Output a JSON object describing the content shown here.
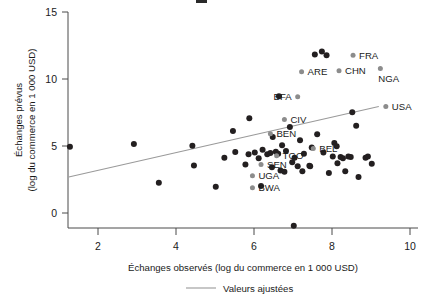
{
  "figure": {
    "width": 430,
    "height": 304,
    "background": "#ffffff",
    "top_crop_artifact": true
  },
  "colors": {
    "point": "#231f20",
    "highlight_point": "#8c8c8c",
    "fit_line": "#9a9a9a",
    "axis": "#4a4a4a",
    "text": "#1a1a1a"
  },
  "chart_data": {
    "type": "scatter",
    "title": "",
    "xlabel": "Échanges observés (log du commerce en 1 000 USD)",
    "ylabel": "Échanges prévus\n(log du commerce en 1 000 USD)",
    "ylabel_line1": "Échanges prévus",
    "ylabel_line2": "(log du commerce en 1 000 USD)",
    "xlim": [
      1.2,
      9.8
    ],
    "ylim": [
      -1.3,
      15.4
    ],
    "xticks": [
      2,
      4,
      6,
      8,
      10
    ],
    "xtick_labels": [
      "2",
      "4",
      "6",
      "8",
      "10"
    ],
    "yticks": [
      0,
      5,
      10,
      15
    ],
    "ytick_labels": [
      "0",
      "5",
      "10",
      "15"
    ],
    "grid": false,
    "legend": {
      "position": "below-axis-center",
      "entries": [
        {
          "label": "Valeurs ajustées",
          "marker": "line",
          "color": "#9a9a9a"
        }
      ]
    },
    "fit_line": {
      "name": "Valeurs ajustées",
      "x_start": 1.25,
      "y_start": 2.68,
      "x_end": 9.2,
      "y_end": 7.95
    },
    "series": [
      {
        "name": "Pays (non étiquetés)",
        "color": "#231f20",
        "points": [
          {
            "x": 1.28,
            "y": 4.95
          },
          {
            "x": 2.92,
            "y": 5.15
          },
          {
            "x": 3.56,
            "y": 2.25
          },
          {
            "x": 4.42,
            "y": 5.02
          },
          {
            "x": 4.46,
            "y": 3.55
          },
          {
            "x": 5.02,
            "y": 1.95
          },
          {
            "x": 5.24,
            "y": 4.12
          },
          {
            "x": 5.46,
            "y": 6.12
          },
          {
            "x": 5.52,
            "y": 4.55
          },
          {
            "x": 5.78,
            "y": 3.62
          },
          {
            "x": 5.86,
            "y": 4.38
          },
          {
            "x": 5.88,
            "y": 7.08
          },
          {
            "x": 6.02,
            "y": 4.52
          },
          {
            "x": 6.12,
            "y": 4.08
          },
          {
            "x": 6.18,
            "y": 2.02
          },
          {
            "x": 6.22,
            "y": 4.72
          },
          {
            "x": 6.34,
            "y": 4.38
          },
          {
            "x": 6.42,
            "y": 4.48
          },
          {
            "x": 6.46,
            "y": 3.42
          },
          {
            "x": 6.48,
            "y": 5.68
          },
          {
            "x": 6.56,
            "y": 4.58
          },
          {
            "x": 6.62,
            "y": 4.42
          },
          {
            "x": 6.64,
            "y": 8.72
          },
          {
            "x": 6.68,
            "y": 3.18
          },
          {
            "x": 6.72,
            "y": 5.05
          },
          {
            "x": 6.78,
            "y": 3.08
          },
          {
            "x": 6.82,
            "y": 4.62
          },
          {
            "x": 6.92,
            "y": 6.42
          },
          {
            "x": 6.98,
            "y": 3.78
          },
          {
            "x": 7.02,
            "y": -0.95
          },
          {
            "x": 7.04,
            "y": 4.12
          },
          {
            "x": 7.12,
            "y": 3.48
          },
          {
            "x": 7.18,
            "y": 5.42
          },
          {
            "x": 7.24,
            "y": 3.12
          },
          {
            "x": 7.28,
            "y": 4.42
          },
          {
            "x": 7.42,
            "y": 3.52
          },
          {
            "x": 7.44,
            "y": 3.48
          },
          {
            "x": 7.48,
            "y": 4.88
          },
          {
            "x": 7.56,
            "y": 11.82
          },
          {
            "x": 7.62,
            "y": 5.88
          },
          {
            "x": 7.74,
            "y": 12.05
          },
          {
            "x": 7.78,
            "y": 4.52
          },
          {
            "x": 7.86,
            "y": 11.78
          },
          {
            "x": 7.92,
            "y": 2.98
          },
          {
            "x": 8.02,
            "y": 4.22
          },
          {
            "x": 8.06,
            "y": 5.22
          },
          {
            "x": 8.12,
            "y": 4.98
          },
          {
            "x": 8.14,
            "y": 3.72
          },
          {
            "x": 8.22,
            "y": 4.18
          },
          {
            "x": 8.28,
            "y": 4.08
          },
          {
            "x": 8.34,
            "y": 3.12
          },
          {
            "x": 8.42,
            "y": 4.22
          },
          {
            "x": 8.48,
            "y": 4.18
          },
          {
            "x": 8.52,
            "y": 7.52
          },
          {
            "x": 8.62,
            "y": 6.52
          },
          {
            "x": 8.68,
            "y": 2.68
          },
          {
            "x": 8.86,
            "y": 4.12
          },
          {
            "x": 8.92,
            "y": 4.22
          },
          {
            "x": 9.02,
            "y": 3.68
          }
        ]
      },
      {
        "name": "Pays étiquetés",
        "color": "#8c8c8c",
        "points": [
          {
            "x": 7.22,
            "y": 10.55,
            "label": "ARE",
            "label_pos": "right"
          },
          {
            "x": 8.54,
            "y": 11.78,
            "label": "FRA",
            "label_pos": "right"
          },
          {
            "x": 8.18,
            "y": 10.62,
            "label": "CHN",
            "label_pos": "right"
          },
          {
            "x": 9.24,
            "y": 10.78,
            "label": "NGA",
            "label_pos": "below-right"
          },
          {
            "x": 7.12,
            "y": 8.68,
            "label": "BFA",
            "label_pos": "left"
          },
          {
            "x": 6.78,
            "y": 6.98,
            "label": "CIV",
            "label_pos": "right"
          },
          {
            "x": 6.42,
            "y": 5.92,
            "label": "BEN",
            "label_pos": "right"
          },
          {
            "x": 7.52,
            "y": 4.82,
            "label": "BEL",
            "label_pos": "right"
          },
          {
            "x": 6.58,
            "y": 4.28,
            "label": "TGO",
            "label_pos": "right"
          },
          {
            "x": 6.18,
            "y": 3.62,
            "label": "SEN",
            "label_pos": "right"
          },
          {
            "x": 5.96,
            "y": 2.78,
            "label": "UGA",
            "label_pos": "right"
          },
          {
            "x": 5.96,
            "y": 1.88,
            "label": "BWA",
            "label_pos": "right"
          },
          {
            "x": 9.38,
            "y": 7.95,
            "label": "USA",
            "label_pos": "right"
          }
        ]
      }
    ]
  }
}
